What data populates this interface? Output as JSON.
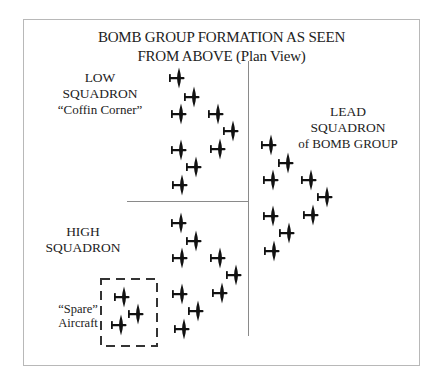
{
  "title": {
    "line1": "BOMB GROUP FORMATION AS SEEN",
    "line2": "FROM ABOVE (Plan View)"
  },
  "labels": {
    "low": {
      "line1": "LOW",
      "line2": "SQUADRON",
      "line3": "“Coffin Corner”"
    },
    "high": {
      "line1": "HIGH",
      "line2": "SQUADRON"
    },
    "lead": {
      "line1": "LEAD",
      "line2": "SQUADRON",
      "line3": "of BOMB GROUP"
    },
    "spare": {
      "line1": "“Spare”",
      "line2": "Aircraft"
    }
  },
  "colors": {
    "aircraft": "#111111",
    "lines": "#8a8a8a",
    "frame": "#b8b8b8"
  },
  "squadrons": {
    "low": {
      "icon": "bomber-aircraft-icon",
      "aircraft": [
        [
          178,
          78
        ],
        [
          193,
          97
        ],
        [
          180,
          114
        ],
        [
          217,
          114
        ],
        [
          232,
          131
        ],
        [
          180,
          150
        ],
        [
          219,
          149
        ],
        [
          195,
          167
        ],
        [
          181,
          185
        ]
      ]
    },
    "high": {
      "icon": "bomber-aircraft-icon",
      "aircraft": [
        [
          180,
          223
        ],
        [
          195,
          241
        ],
        [
          181,
          258
        ],
        [
          219,
          258
        ],
        [
          235,
          275
        ],
        [
          181,
          294
        ],
        [
          221,
          293
        ],
        [
          197,
          311
        ],
        [
          183,
          329
        ]
      ]
    },
    "lead": {
      "icon": "bomber-aircraft-icon",
      "aircraft": [
        [
          270,
          145
        ],
        [
          287,
          163
        ],
        [
          272,
          180
        ],
        [
          310,
          180
        ],
        [
          326,
          197
        ],
        [
          272,
          216
        ],
        [
          312,
          215
        ],
        [
          288,
          233
        ],
        [
          273,
          251
        ]
      ]
    },
    "spare": {
      "icon": "bomber-aircraft-icon",
      "aircraft": [
        [
          123,
          297
        ],
        [
          137,
          314
        ],
        [
          120,
          325
        ]
      ]
    }
  }
}
